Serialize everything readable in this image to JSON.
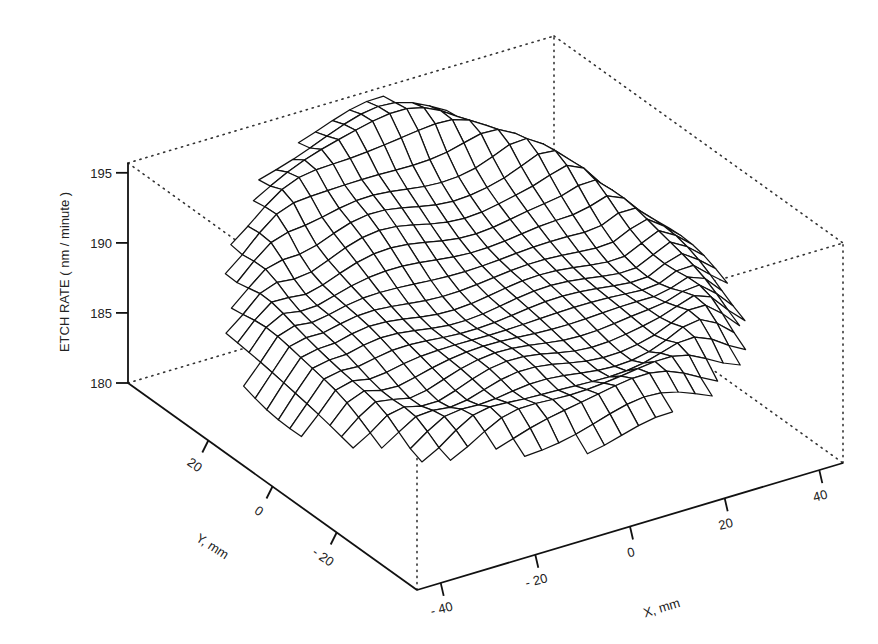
{
  "chart_data": {
    "type": "surface3d",
    "title": "",
    "zlabel": "ETCH RATE ( nm / minute )",
    "xlabel": "X, mm",
    "ylabel": "Y, mm",
    "z_ticks": [
      "180",
      "185",
      "190",
      "195"
    ],
    "z_tick_values": [
      180,
      185,
      190,
      195
    ],
    "x_ticks": [
      "- 40",
      "- 20",
      "0",
      "20",
      "40"
    ],
    "x_tick_values": [
      -40,
      -20,
      0,
      20,
      40
    ],
    "y_ticks": [
      "20",
      "0",
      "- 20"
    ],
    "y_tick_values": [
      20,
      0,
      -20
    ],
    "xlim": [
      -45,
      45
    ],
    "ylim": [
      -45,
      45
    ],
    "zlim": [
      180,
      196
    ],
    "grid_size": 25,
    "surface_summary": {
      "max": 195.5,
      "center": 190.5,
      "front_edge_min": 182
    },
    "box": "dotted bounding box"
  }
}
